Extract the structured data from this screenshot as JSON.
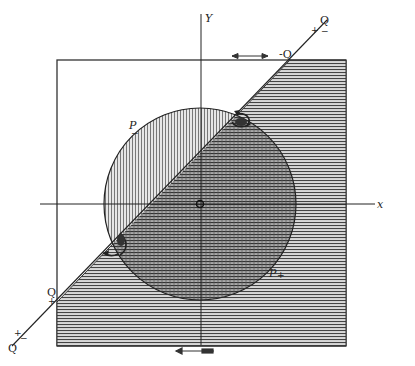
{
  "figure": {
    "type": "geometric-diagram",
    "axes": {
      "x_label": "x",
      "y_label": "Y"
    },
    "square": {
      "x": 57,
      "y": 60,
      "width": 289,
      "height": 286
    },
    "circle": {
      "cx": 200,
      "cy": 204,
      "r": 96
    },
    "diagonal_line": {
      "x1": 12,
      "y1": 346,
      "x2": 327,
      "y2": 20
    },
    "labels": {
      "top_q": "Q",
      "top_plus": "+",
      "top_minus": "−",
      "neg_q": "-Q",
      "left_q": "Q",
      "left_plus": "+",
      "bottom_q": "Q",
      "bottom_plus": "+",
      "bottom_minus": "−",
      "p_upper": "P",
      "p_upper_sub": "−",
      "p_lower": "P",
      "p_lower_sub": "+",
      "origin": "O"
    },
    "colors": {
      "ink": "#222222",
      "hatch_horizontal": "#555555",
      "hatch_vertical": "#777777",
      "paper": "#ffffff"
    }
  }
}
